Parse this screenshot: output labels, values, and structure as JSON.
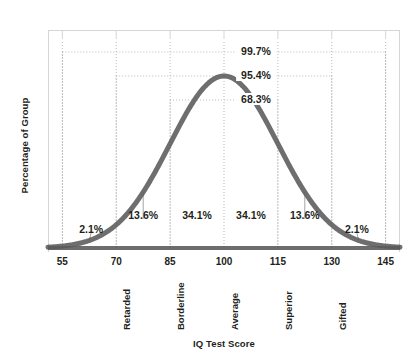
{
  "chart_data": {
    "type": "area",
    "title": "",
    "xlabel": "IQ Test Score",
    "ylabel": "Percentage of Group",
    "xlim": [
      51,
      149
    ],
    "ylim": [
      0,
      1.08
    ],
    "grid": false,
    "legend": "none",
    "distribution": {
      "kind": "normal",
      "mean": 100,
      "std_dev": 15
    },
    "x_ticks": [
      {
        "value": 55,
        "label": "55"
      },
      {
        "value": 70,
        "label": "70"
      },
      {
        "value": 85,
        "label": "85"
      },
      {
        "value": 100,
        "label": "100"
      },
      {
        "value": 115,
        "label": "115"
      },
      {
        "value": 130,
        "label": "130"
      },
      {
        "value": 145,
        "label": "145"
      }
    ],
    "category_labels": [
      {
        "value": 70,
        "label": "Retarded"
      },
      {
        "value": 85,
        "label": "Borderline"
      },
      {
        "value": 100,
        "label": "Average"
      },
      {
        "value": 115,
        "label": "Superior"
      },
      {
        "value": 130,
        "label": "Gifted"
      }
    ],
    "region_percentages": [
      {
        "label": "2.1%",
        "from": 55,
        "to": 70,
        "anchor_x": 63,
        "leader": true
      },
      {
        "label": "13.6%",
        "from": 70,
        "to": 85,
        "anchor_x": 77.5,
        "leader": true
      },
      {
        "label": "34.1%",
        "from": 85,
        "to": 100,
        "anchor_x": 92.5,
        "leader": false
      },
      {
        "label": "34.1%",
        "from": 100,
        "to": 115,
        "anchor_x": 107.5,
        "leader": false
      },
      {
        "label": "13.6%",
        "from": 115,
        "to": 130,
        "anchor_x": 122.5,
        "leader": true
      },
      {
        "label": "2.1%",
        "from": 130,
        "to": 145,
        "anchor_x": 137,
        "leader": true
      }
    ],
    "brackets": [
      {
        "label": "99.7%",
        "from": 55,
        "to": 145,
        "sigma": 3
      },
      {
        "label": "95.4%",
        "from": 70,
        "to": 130,
        "sigma": 2
      },
      {
        "label": "68.3%",
        "from": 85,
        "to": 115,
        "sigma": 1
      }
    ],
    "curve_color": "#5a5a5a",
    "frame_color": "#d5d5d5",
    "dotted_color": "#b9b9b9",
    "text_color": "#231f20"
  }
}
